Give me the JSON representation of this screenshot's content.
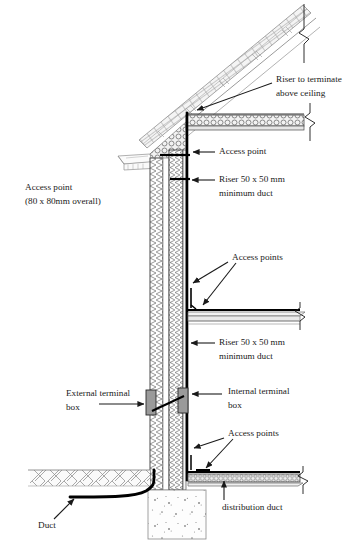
{
  "figure": {
    "type": "architectural-section-diagram",
    "background_color": "#ffffff",
    "line_color": "#1a1a1a",
    "hatch_gray": "#8a8a8a"
  },
  "labels": {
    "riser_terminate": {
      "line1": "Riser to terminate",
      "line2": "above ceiling"
    },
    "access_point_top": "Access point",
    "riser_duct_upper": {
      "line1": "Riser 50 x 50 mm",
      "line2": "minimum duct"
    },
    "access_point_left": {
      "line1": "Access point",
      "line2": "(80 x 80mm overall)"
    },
    "access_points_mid": "Access points",
    "riser_duct_lower": {
      "line1": "Riser 50 x 50 mm",
      "line2": "minimum duct"
    },
    "external_terminal_box": {
      "line1": "External terminal",
      "line2": "box"
    },
    "internal_terminal_box": {
      "line1": "Internal terminal",
      "line2": "box"
    },
    "access_points_bottom": "Access points",
    "distribution_duct": "distribution duct",
    "duct": "Duct"
  },
  "components": [
    {
      "name": "pitched-roof",
      "description": "Sloping roof with tiles, battens and rafters rising to upper right"
    },
    {
      "name": "ceiling-insulation",
      "description": "Horizontal ceiling build-up with circular bubble insulation hatch"
    },
    {
      "name": "cavity-wall",
      "description": "Vertical twin-leaf cavity wall with blockwork hatch on both leaves"
    },
    {
      "name": "vertical-riser-duct",
      "description": "Heavy black vertical riser line running up the inner face of the wall"
    },
    {
      "name": "intermediate-floor",
      "description": "Mid-level floor slab with horizontal duct run"
    },
    {
      "name": "ground-floor-slab",
      "description": "Ground level floor with in-screed distribution duct"
    },
    {
      "name": "external-terminal-box",
      "description": "Grey rectangular box on the outer face of the wall"
    },
    {
      "name": "internal-terminal-box",
      "description": "Grey rectangular box on the inner face of the wall"
    },
    {
      "name": "ground-hatch",
      "description": "Diagonal cross-hatched ground / earth to the left of the wall"
    },
    {
      "name": "foundation",
      "description": "Concrete foundation pad below ground with aggregate speckles"
    },
    {
      "name": "incoming-duct",
      "description": "Heavy black buried duct curving from the left up into the wall"
    },
    {
      "name": "break-lines",
      "description": "Zigzag break symbols terminating the roof, ceiling and floors at the right"
    }
  ],
  "annotation_arrows": [
    {
      "name": "arrow-riser-terminate",
      "points_to": "top of vertical riser above ceiling"
    },
    {
      "name": "arrow-access-point-top",
      "points_to": "access point just below ceiling"
    },
    {
      "name": "arrow-riser-duct-upper",
      "points_to": "riser duct in wall below ceiling"
    },
    {
      "name": "arrow-access-points-mid-a",
      "points_to": "upper access point at intermediate floor"
    },
    {
      "name": "arrow-access-points-mid-b",
      "points_to": "lower access point at intermediate floor"
    },
    {
      "name": "arrow-riser-duct-lower",
      "points_to": "riser duct below intermediate floor"
    },
    {
      "name": "arrow-external-terminal-box",
      "points_to": "external terminal box"
    },
    {
      "name": "arrow-internal-terminal-box",
      "points_to": "internal terminal box"
    },
    {
      "name": "arrow-access-points-bottom-a",
      "points_to": "access point above ground floor"
    },
    {
      "name": "arrow-access-points-bottom-b",
      "points_to": "access point in ground floor duct"
    },
    {
      "name": "arrow-distribution-duct",
      "points_to": "distribution duct in floor screed"
    },
    {
      "name": "arrow-duct",
      "points_to": "buried incoming duct"
    }
  ]
}
